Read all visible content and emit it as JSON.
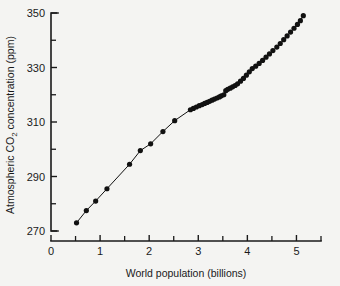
{
  "figure": {
    "background_color": "#f4f4f2",
    "ink_color": "#1a1a1a",
    "marker_color": "#111111"
  },
  "chart_data": {
    "type": "scatter",
    "title": "",
    "xlabel": "World population (billions)",
    "ylabel": "Atmospheric CO2 concentration (ppm)",
    "ylabel_parts": {
      "prefix": "Atmospheric CO",
      "subscript": "2",
      "suffix": " concentration (ppm)"
    },
    "xlim": [
      0,
      5.5
    ],
    "ylim": [
      270,
      350
    ],
    "grid": false,
    "legend": null,
    "x_major_ticks": [
      0,
      1,
      2,
      3,
      4,
      5
    ],
    "x_major_tick_labels": [
      "0",
      "1",
      "2",
      "3",
      "4",
      "5"
    ],
    "x_minor_ticks": [
      0.5,
      1.5,
      2.5,
      3.5,
      4.5,
      5.5
    ],
    "y_major_ticks": [
      270,
      290,
      310,
      330,
      350
    ],
    "y_major_tick_labels": [
      "270",
      "290",
      "310",
      "330",
      "350"
    ],
    "y_minor_ticks": [
      280,
      300,
      320,
      340
    ],
    "marker_style": "filled-circle",
    "connected": true,
    "series": [
      {
        "name": "CO2 vs world population",
        "x": [
          0.52,
          0.72,
          0.91,
          1.14,
          1.6,
          1.82,
          2.03,
          2.28,
          2.52,
          2.84,
          2.9,
          2.96,
          3.02,
          3.08,
          3.13,
          3.18,
          3.23,
          3.28,
          3.33,
          3.38,
          3.43,
          3.47,
          3.52,
          3.56,
          3.6,
          3.65,
          3.7,
          3.75,
          3.8,
          3.86,
          3.92,
          3.98,
          4.04,
          4.1,
          4.17,
          4.24,
          4.31,
          4.38,
          4.45,
          4.52,
          4.6,
          4.67,
          4.74,
          4.81,
          4.88,
          4.95,
          5.02,
          5.08,
          5.14
        ],
        "y": [
          273.0,
          277.5,
          281.0,
          285.5,
          294.5,
          299.5,
          302.0,
          306.5,
          310.5,
          314.5,
          315.0,
          315.5,
          316.0,
          316.4,
          316.8,
          317.2,
          317.6,
          318.0,
          318.4,
          318.8,
          319.2,
          319.6,
          320.0,
          321.5,
          322.0,
          322.4,
          322.9,
          323.4,
          324.0,
          325.0,
          326.0,
          327.2,
          328.4,
          329.6,
          330.5,
          331.5,
          332.6,
          333.8,
          335.0,
          336.2,
          337.5,
          338.8,
          340.2,
          341.6,
          343.0,
          344.4,
          345.8,
          347.2,
          349.0
        ]
      }
    ]
  }
}
